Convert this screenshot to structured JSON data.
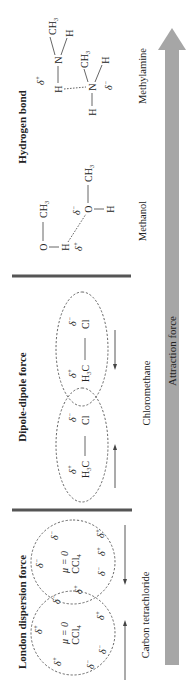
{
  "sections": [
    {
      "title": "London dispersion force",
      "compound": "Carbon tetrachloride",
      "molecule": {
        "formula_main": "CCl",
        "formula_sub": "4",
        "dipole_text": "μ = 0"
      },
      "delta_plus": "δ",
      "delta_sign_plus": "+",
      "delta_sign_minus": "−"
    },
    {
      "title": "Dipole-dipole force",
      "compound": "Chloromethane",
      "molecule": {
        "left_main": "H",
        "left_sub": "3",
        "left_tail": "C",
        "bond": "—",
        "right": "Cl"
      }
    },
    {
      "title": "Hydrogen bond",
      "compounds": [
        "Methanol",
        "Methylamine"
      ],
      "methanol": {
        "O": "O",
        "H": "H",
        "CH3_main": "CH",
        "CH3_sub": "3"
      },
      "methylamine": {
        "N": "N",
        "H": "H",
        "CH3_main": "CH",
        "CH3_sub": "3"
      }
    }
  ],
  "axis": {
    "label": "Attraction force",
    "color": "#a6a6a6"
  },
  "delta": {
    "symbol": "δ",
    "plus": "+",
    "minus": "−"
  }
}
